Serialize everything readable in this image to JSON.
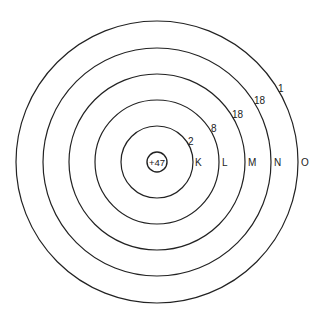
{
  "diagram": {
    "type": "bohr-atom-model",
    "nucleus": {
      "charge_label": "+47"
    },
    "shells": [
      {
        "name": "K",
        "electrons": "2"
      },
      {
        "name": "L",
        "electrons": "8"
      },
      {
        "name": "M",
        "electrons": "18"
      },
      {
        "name": "N",
        "electrons": "18"
      },
      {
        "name": "O",
        "electrons": "1"
      }
    ]
  }
}
